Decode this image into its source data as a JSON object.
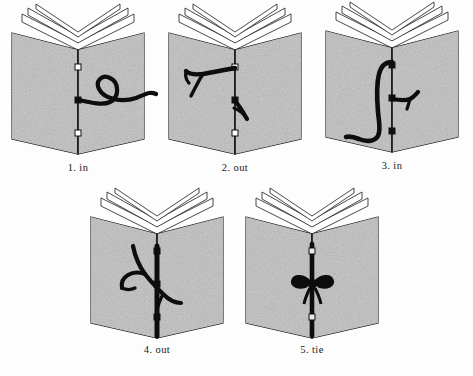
{
  "document": {
    "type": "instructional-diagram",
    "subject": "pamphlet stitch bookbinding sequence",
    "background_color": "#fdfdfd",
    "ink_color": "#111111",
    "cover_texture_color": "#9a9a9a"
  },
  "figures": [
    {
      "id": "figure-1",
      "number": "1.",
      "label": "in",
      "caption": "1.  in",
      "description": "Open book seen from front; needle and thread enter through the middle hole of the spine and the loose thread curls out across the right cover.",
      "holes": [
        "top",
        "middle",
        "bottom"
      ],
      "thread_entry_hole": "middle",
      "thread_side": "right"
    },
    {
      "id": "figure-2",
      "number": "2.",
      "label": "out",
      "caption": "2.  out",
      "description": "Thread passes out through the top hole onto the left cover and a second short end emerges at the middle hole on the right cover.",
      "holes": [
        "top",
        "middle",
        "bottom"
      ],
      "thread_entry_hole": "top",
      "thread_side": "left"
    },
    {
      "id": "figure-3",
      "number": "3.",
      "label": "in",
      "caption": "3.  in",
      "description": "Long loop of thread hangs down the left cover from the top hole and a short tail sticks out at the middle hole on the right cover.",
      "holes": [
        "top",
        "middle",
        "bottom"
      ],
      "thread_entry_hole": "bottom",
      "thread_side": "left"
    },
    {
      "id": "figure-4",
      "number": "4.",
      "label": "out",
      "caption": "4.  out",
      "description": "Thread runs the full length of the spine with crossing ends emerging near the middle of the left and right covers.",
      "holes": [
        "top",
        "middle",
        "bottom"
      ],
      "thread_entry_hole": "middle",
      "thread_side": "both"
    },
    {
      "id": "figure-5",
      "number": "5.",
      "label": "tie",
      "caption": "5.  tie",
      "description": "Both thread ends are tied in a bow knot at the centre of the spine, completing the stitch.",
      "holes": [
        "top",
        "middle",
        "bottom"
      ],
      "thread_entry_hole": "middle",
      "thread_side": "center",
      "knot": "bow"
    }
  ]
}
